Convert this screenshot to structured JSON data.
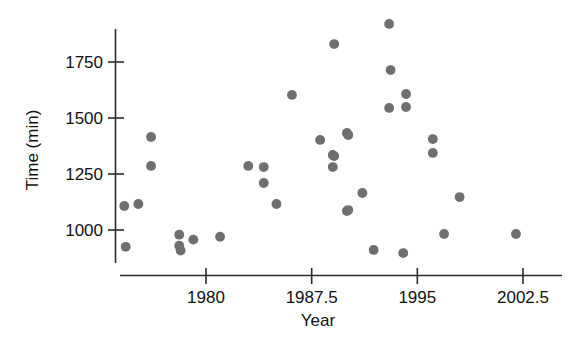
{
  "chart_data": {
    "type": "scatter",
    "title": "",
    "xlabel": "Year",
    "ylabel": "Time (min)",
    "xlim": [
      1973.0,
      2004.5
    ],
    "ylim": [
      860,
      1960
    ],
    "grid": false,
    "legend": "none",
    "marker": {
      "shape": "circle",
      "color": "#6f6f6f",
      "size": 6
    },
    "xticks": [
      1980,
      1987.5,
      1995,
      2002.5
    ],
    "xtick_labels": [
      "1980",
      "1987.5",
      "1995",
      "2002.5"
    ],
    "yticks": [
      1000,
      1250,
      1500,
      1750
    ],
    "ytick_labels": [
      "1000",
      "1250",
      "1500",
      "1750"
    ],
    "x": [
      1974.2,
      1974.3,
      1975.2,
      1976.1,
      1976.1,
      1978.1,
      1978.1,
      1978.2,
      1979.1,
      1981.0,
      1983.0,
      1984.1,
      1984.1,
      1985.0,
      1986.1,
      1988.1,
      1989.0,
      1989.0,
      1989.1,
      1989.1,
      1990.0,
      1990.0,
      1990.1,
      1990.1,
      1991.1,
      1991.9,
      1993.0,
      1993.0,
      1993.1,
      1994.0,
      1994.2,
      1994.2,
      1996.1,
      1996.1,
      1996.9,
      1998.0,
      2002.0
    ],
    "y": [
      1107,
      925,
      1116,
      1415,
      1286,
      979,
      930,
      908,
      957,
      970,
      1286,
      1281,
      1210,
      1116,
      1603,
      1402,
      1281,
      1335,
      1330,
      1830,
      1433,
      1085,
      1424,
      1089,
      1165,
      911,
      1920,
      1545,
      1714,
      897,
      1607,
      1549,
      1406,
      1344,
      982,
      1147,
      982
    ],
    "points": [
      {
        "x": 1974.2,
        "y": 1107
      },
      {
        "x": 1974.3,
        "y": 925
      },
      {
        "x": 1975.2,
        "y": 1116
      },
      {
        "x": 1976.1,
        "y": 1415
      },
      {
        "x": 1976.1,
        "y": 1286
      },
      {
        "x": 1978.1,
        "y": 979
      },
      {
        "x": 1978.1,
        "y": 930
      },
      {
        "x": 1978.2,
        "y": 908
      },
      {
        "x": 1979.1,
        "y": 957
      },
      {
        "x": 1981.0,
        "y": 970
      },
      {
        "x": 1983.0,
        "y": 1286
      },
      {
        "x": 1984.1,
        "y": 1281
      },
      {
        "x": 1984.1,
        "y": 1210
      },
      {
        "x": 1985.0,
        "y": 1116
      },
      {
        "x": 1986.1,
        "y": 1603
      },
      {
        "x": 1988.1,
        "y": 1402
      },
      {
        "x": 1989.0,
        "y": 1281
      },
      {
        "x": 1989.0,
        "y": 1335
      },
      {
        "x": 1989.1,
        "y": 1330
      },
      {
        "x": 1989.1,
        "y": 1830
      },
      {
        "x": 1990.0,
        "y": 1433
      },
      {
        "x": 1990.0,
        "y": 1085
      },
      {
        "x": 1990.1,
        "y": 1424
      },
      {
        "x": 1990.1,
        "y": 1089
      },
      {
        "x": 1991.1,
        "y": 1165
      },
      {
        "x": 1991.9,
        "y": 911
      },
      {
        "x": 1993.0,
        "y": 1920
      },
      {
        "x": 1993.0,
        "y": 1545
      },
      {
        "x": 1993.1,
        "y": 1714
      },
      {
        "x": 1994.0,
        "y": 897
      },
      {
        "x": 1994.2,
        "y": 1607
      },
      {
        "x": 1994.2,
        "y": 1549
      },
      {
        "x": 1996.1,
        "y": 1406
      },
      {
        "x": 1996.1,
        "y": 1344
      },
      {
        "x": 1996.9,
        "y": 982
      },
      {
        "x": 1998.0,
        "y": 1147
      },
      {
        "x": 2002.0,
        "y": 982
      }
    ]
  },
  "colors": {
    "marker": "#6f6f6f",
    "axis": "#2b2b2b",
    "text": "#111111",
    "background": "#ffffff"
  }
}
